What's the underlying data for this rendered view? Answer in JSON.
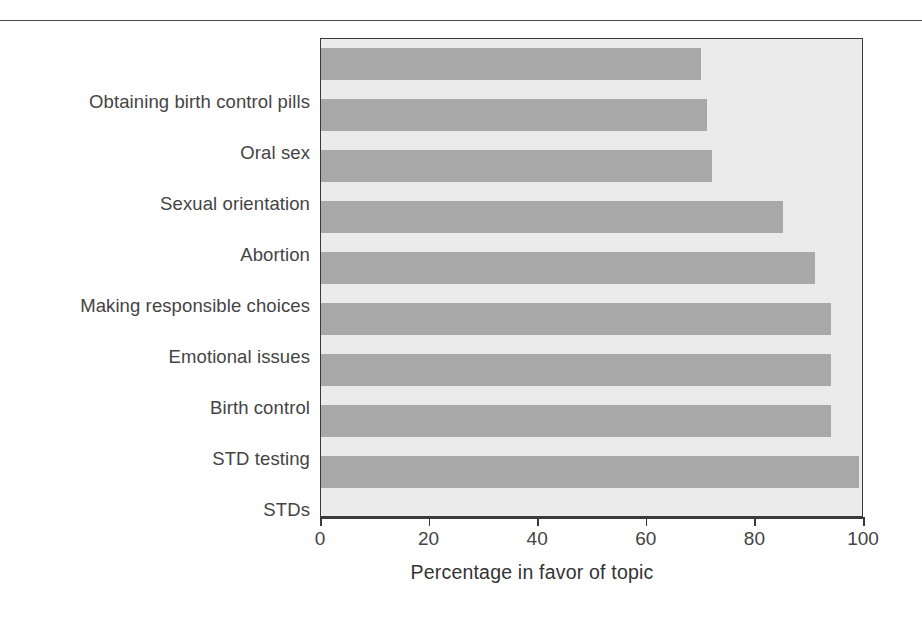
{
  "chart_data": {
    "type": "bar",
    "orientation": "horizontal",
    "title": "",
    "subtitle": "",
    "xlabel": "Percentage in favor of topic",
    "ylabel": "",
    "categories": [
      "Obtaining birth control pills",
      "Oral sex",
      "Sexual orientation",
      "Abortion",
      "Making responsible choices",
      "Emotional issues",
      "Birth control",
      "STD testing",
      "STDs"
    ],
    "values": [
      70,
      71,
      72,
      85,
      91,
      94,
      94,
      94,
      99
    ],
    "xlim": [
      0,
      100
    ],
    "xticks": [
      0,
      20,
      40,
      60,
      80,
      100
    ],
    "xtick_labels": [
      "0",
      "20",
      "40",
      "60",
      "80",
      "100"
    ],
    "grid": false,
    "legend": false,
    "legend_position": "none",
    "series": [
      {
        "name": "Percentage in favor of topic",
        "values": [
          70,
          71,
          72,
          85,
          91,
          94,
          94,
          94,
          99
        ]
      }
    ]
  },
  "style": {
    "bar_color": "#a8a8a8",
    "plot_background": "#ebebeb",
    "axis_color": "#3a3a3a",
    "text_color": "#444444",
    "page_background": "#ffffff",
    "rule_color": "#4a4a4a"
  }
}
